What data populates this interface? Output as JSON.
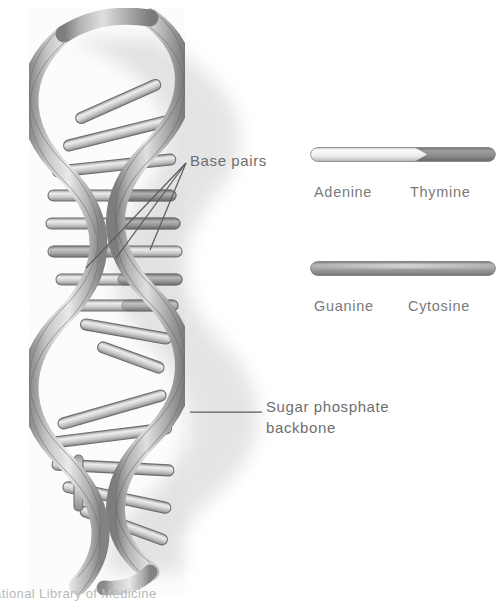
{
  "figure": {
    "title_alt": "DNA double helix structure",
    "background_color": "#ffffff",
    "ink_color": "#6e6e6e"
  },
  "annotations": {
    "base_pairs": {
      "label": "Base pairs",
      "leader_lines": 3
    },
    "sugar_phosphate": {
      "line1": "Sugar phosphate",
      "line2": "backbone",
      "leader_lines": 1
    }
  },
  "legend": {
    "pairs": [
      {
        "id": "adenine-thymine",
        "left_label": "Adenine",
        "right_label": "Thymine",
        "left_color": "#f2f2f2",
        "right_color": "#8d8d8d",
        "two_tone": true
      },
      {
        "id": "guanine-cytosine",
        "left_label": "Guanine",
        "right_label": "Cytosine",
        "left_color": "#9a9a9a",
        "right_color": "#9a9a9a",
        "two_tone": false
      }
    ]
  },
  "footer": {
    "credit": "ational Library of Medicine"
  }
}
